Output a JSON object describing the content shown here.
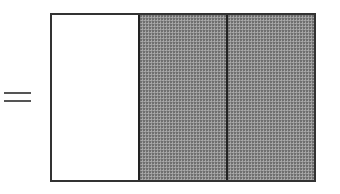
{
  "diagram": {
    "equals_symbol": "=",
    "fraction_bar": {
      "total_parts": 3,
      "shaded_parts": 2,
      "parts": [
        {
          "index": 1,
          "shaded": false,
          "fill": "#ffffff"
        },
        {
          "index": 2,
          "shaded": true,
          "fill": "#8f8f8f"
        },
        {
          "index": 3,
          "shaded": true,
          "fill": "#8f8f8f"
        }
      ]
    },
    "colors": {
      "border": "#333333",
      "shaded": "#8f8f8f",
      "unshaded": "#ffffff"
    }
  }
}
